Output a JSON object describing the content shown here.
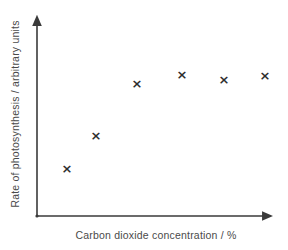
{
  "chart_data": {
    "type": "scatter",
    "title": "",
    "subtitle": "",
    "xlabel": "Carbon dioxide concentration / %",
    "ylabel": "Rate of photosynthesis / arbitrary units",
    "xlim": [
      0,
      100
    ],
    "ylim": [
      0,
      100
    ],
    "xticks": [],
    "yticks": [],
    "xticklabels": [],
    "yticklabels": [],
    "grid": false,
    "legend": null,
    "legend_position": "none",
    "annotations": [],
    "marker": "x",
    "marker_color": "#2e2e2e",
    "axis_color": "#3a3a3a",
    "background_color": "#ffffff",
    "text_color": "#4a4a4a",
    "series": [
      {
        "name": "Rate of photosynthesis",
        "points": [
          {
            "x": 12.6,
            "y": 23.6,
            "px": 67,
            "py": 168
          },
          {
            "x": 24.8,
            "y": 39.9,
            "px": 96,
            "py": 135
          },
          {
            "x": 42.0,
            "y": 65.5,
            "px": 137,
            "py": 83
          },
          {
            "x": 60.9,
            "y": 70.0,
            "px": 182,
            "py": 74
          },
          {
            "x": 78.6,
            "y": 67.5,
            "px": 224,
            "py": 79
          },
          {
            "x": 95.8,
            "y": 69.5,
            "px": 265,
            "py": 75
          }
        ]
      }
    ]
  },
  "axes": {
    "y_axis_name": "y-axis-arrow",
    "x_axis_name": "x-axis-arrow",
    "origin_px": {
      "x": 37,
      "y": 216
    },
    "y_top_px": {
      "x": 37,
      "y": 13
    },
    "x_right_px": {
      "x": 275,
      "y": 216
    }
  }
}
